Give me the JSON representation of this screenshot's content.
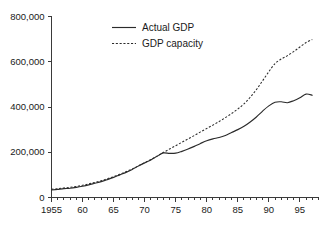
{
  "chart_data": {
    "type": "line",
    "title": "",
    "xlabel": "",
    "ylabel": "",
    "xlim": [
      1955,
      1998
    ],
    "ylim": [
      0,
      800000
    ],
    "grid": false,
    "legend_position": "top-center",
    "y_ticks": [
      0,
      200000,
      400000,
      600000,
      800000
    ],
    "y_tick_labels": [
      "0",
      "200,000",
      "400,000",
      "600,000",
      "800,000"
    ],
    "x_ticks": [
      1955,
      1960,
      1965,
      1970,
      1975,
      1980,
      1985,
      1990,
      1995
    ],
    "x_tick_labels": [
      "1955",
      "60",
      "65",
      "70",
      "75",
      "80",
      "85",
      "90",
      "95"
    ],
    "x_minor_tick_interval": 1,
    "x": [
      1955,
      1956,
      1957,
      1958,
      1959,
      1960,
      1961,
      1962,
      1963,
      1964,
      1965,
      1966,
      1967,
      1968,
      1969,
      1970,
      1971,
      1972,
      1973,
      1974,
      1975,
      1976,
      1977,
      1978,
      1979,
      1980,
      1981,
      1982,
      1983,
      1984,
      1985,
      1986,
      1987,
      1988,
      1989,
      1990,
      1991,
      1992,
      1993,
      1994,
      1995,
      1996,
      1997
    ],
    "series": [
      {
        "name": "Actual GDP",
        "style": "solid",
        "color": "#2b2b2b",
        "values": [
          33000,
          36000,
          39000,
          41000,
          45000,
          50000,
          56000,
          63000,
          70000,
          79000,
          89000,
          100000,
          111000,
          124000,
          139000,
          153000,
          166000,
          182000,
          197000,
          195000,
          196000,
          204000,
          214000,
          226000,
          239000,
          251000,
          259000,
          265000,
          274000,
          287000,
          300000,
          315000,
          334000,
          356000,
          382000,
          405000,
          421000,
          423000,
          419000,
          428000,
          441000,
          457000,
          452000
        ]
      },
      {
        "name": "GDP capacity",
        "style": "dashed",
        "color": "#2b2b2b",
        "values": [
          36000,
          39000,
          42000,
          45000,
          49000,
          54000,
          60000,
          67000,
          74000,
          83000,
          92000,
          103000,
          114000,
          126000,
          140000,
          154000,
          168000,
          183000,
          199000,
          214000,
          229000,
          244000,
          259000,
          274000,
          290000,
          305000,
          320000,
          336000,
          353000,
          371000,
          391000,
          414000,
          443000,
          477000,
          516000,
          556000,
          592000,
          612000,
          627000,
          645000,
          665000,
          685000,
          698000
        ]
      }
    ]
  },
  "legend": {
    "items": [
      {
        "label": "Actual GDP",
        "style": "solid"
      },
      {
        "label": "GDP capacity",
        "style": "dashed"
      }
    ]
  }
}
